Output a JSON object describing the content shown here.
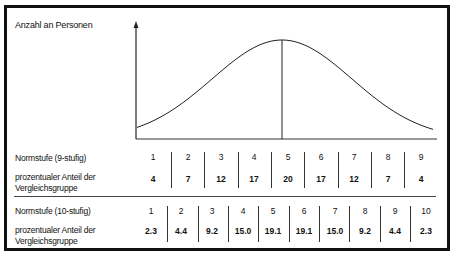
{
  "chart_data": {
    "type": "line",
    "title": "",
    "ylabel": "Anzahl an Personen",
    "xlabel": "",
    "curve": {
      "shape": "normal",
      "mean_marker": true
    },
    "tables": [
      {
        "row_label": "Normstufe (9-stufig)",
        "value_label": "prozentualer Anteil der Vergleichsgruppe",
        "categories": [
          "1",
          "2",
          "3",
          "4",
          "5",
          "6",
          "7",
          "8",
          "9"
        ],
        "values": [
          4,
          7,
          12,
          17,
          20,
          17,
          12,
          7,
          4
        ]
      },
      {
        "row_label": "Normstufe (10-stufig)",
        "value_label": "prozentualer Anteil der Vergleichsgruppe",
        "categories": [
          "1",
          "2",
          "3",
          "4",
          "5",
          "6",
          "7",
          "8",
          "9",
          "10"
        ],
        "values": [
          2.3,
          4.4,
          9.2,
          15.0,
          19.1,
          19.1,
          15.0,
          9.2,
          4.4,
          2.3
        ]
      }
    ],
    "grid": false,
    "legend": null
  },
  "labels": {
    "y_axis": "Anzahl an Personen",
    "stanine_row": "Normstufe (9-stufig)",
    "stanine_pct_line1": "prozentualer Anteil der",
    "stanine_pct_line2": "Vergleichsgruppe",
    "sten_row": "Normstufe (10-stufig)",
    "sten_pct_line1": "prozentualer Anteil der",
    "sten_pct_line2": "Vergleichsgruppe"
  },
  "stanine": {
    "levels": [
      "1",
      "2",
      "3",
      "4",
      "5",
      "6",
      "7",
      "8",
      "9"
    ],
    "percent": [
      "4",
      "7",
      "12",
      "17",
      "20",
      "17",
      "12",
      "7",
      "4"
    ]
  },
  "sten": {
    "levels": [
      "1",
      "2",
      "3",
      "4",
      "5",
      "6",
      "7",
      "8",
      "9",
      "10"
    ],
    "percent": [
      "2.3",
      "4.4",
      "9.2",
      "15.0",
      "19.1",
      "19.1",
      "15.0",
      "9.2",
      "4.4",
      "2.3"
    ]
  }
}
